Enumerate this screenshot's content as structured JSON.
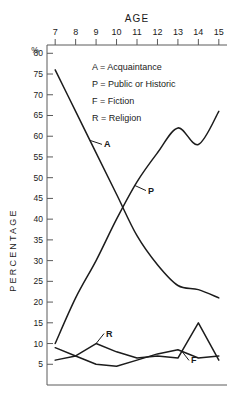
{
  "chart_data": {
    "type": "line",
    "title": "AGE",
    "xlabel": "AGE",
    "ylabel": "PERCENTAGE",
    "y_unit_symbol": "%",
    "x": [
      7,
      8,
      9,
      10,
      11,
      12,
      13,
      14,
      15
    ],
    "xlim": [
      6.6,
      15.4
    ],
    "ylim": [
      0,
      82
    ],
    "xticks": [
      "7",
      "8",
      "9",
      "10",
      "11",
      "12",
      "13",
      "14",
      "15"
    ],
    "yticks": [
      "80",
      "75",
      "70",
      "65",
      "60",
      "55",
      "50",
      "45",
      "40",
      "35",
      "30",
      "25",
      "20",
      "15",
      "10",
      "5"
    ],
    "grid": false,
    "x_axis_position": "top",
    "legend_position": "upper-right-inside",
    "series": [
      {
        "name": "Acquaintance",
        "key": "A",
        "label": "A",
        "values": [
          76,
          66,
          56,
          46,
          36,
          29,
          24,
          23,
          21
        ]
      },
      {
        "name": "Public or Historic",
        "key": "P",
        "label": "P",
        "values": [
          10,
          21,
          30,
          40,
          49,
          56,
          62,
          58,
          66
        ]
      },
      {
        "name": "Fiction",
        "key": "F",
        "label": "F",
        "values": [
          9,
          7,
          5,
          4.5,
          6,
          7.5,
          8.5,
          6.5,
          7
        ]
      },
      {
        "name": "Religion",
        "key": "R",
        "label": "R",
        "values": [
          6,
          7,
          10,
          8,
          6.5,
          7,
          6.5,
          15,
          6
        ]
      }
    ]
  },
  "legend": {
    "items": [
      {
        "key": "A",
        "sep": "=",
        "name": "Acquaintance"
      },
      {
        "key": "P",
        "sep": "=",
        "name": "Public or Historic"
      },
      {
        "key": "F",
        "sep": "=",
        "name": "Fiction"
      },
      {
        "key": "R",
        "sep": "=",
        "name": "Religion"
      }
    ]
  },
  "axes": {
    "x_title": "AGE",
    "y_title": "PERCENTAGE",
    "percent_symbol": "%"
  }
}
